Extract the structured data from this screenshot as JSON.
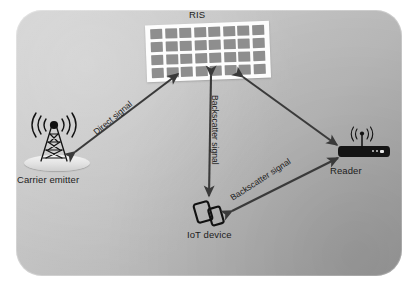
{
  "diagram": {
    "title_label": "RIS",
    "nodes": [
      {
        "id": "ris",
        "label": "RIS",
        "icon": "ris-panel-icon"
      },
      {
        "id": "carrier",
        "label": "Carrier emitter",
        "icon": "antenna-tower-icon"
      },
      {
        "id": "reader",
        "label": "Reader",
        "icon": "router-icon"
      },
      {
        "id": "iot",
        "label": "IoT device",
        "icon": "iot-device-icon"
      }
    ],
    "links": [
      {
        "id": "direct",
        "label": "Direct signal",
        "from": "carrier",
        "to": "ris",
        "arrow": "double"
      },
      {
        "id": "backscatter_vertical",
        "label": "Backscatter signal",
        "from": "ris",
        "to": "iot",
        "arrow": "double"
      },
      {
        "id": "backscatter_diagonal",
        "label": "Backscatter signal",
        "from": "iot",
        "to": "reader",
        "arrow": "double"
      },
      {
        "id": "ris_reader",
        "label": "",
        "from": "ris",
        "to": "reader",
        "arrow": "double"
      }
    ],
    "ris_panel": {
      "rows": 4,
      "columns": 8,
      "cell_count": 32,
      "cell_color": "#8e8e8e",
      "board_color": "#fdfdfd"
    },
    "colors": {
      "background": "#ffffff",
      "panel_light": "#d2d2d2",
      "panel_dark": "#9d9d9d",
      "arrow": "#3a3a3a",
      "text": "#1c1c1c",
      "reader_body": "#141414"
    }
  }
}
